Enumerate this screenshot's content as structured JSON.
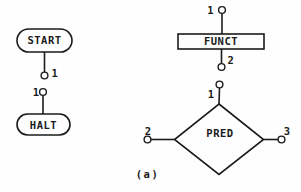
{
  "figure": {
    "caption": "(a)",
    "colors": {
      "ink": "#1b1b1b",
      "paper": "#fefefe"
    },
    "nodes": {
      "start": {
        "shape": "rounded-terminal",
        "label": "START",
        "ports": [
          "1"
        ]
      },
      "halt": {
        "shape": "rounded-terminal",
        "label": "HALT",
        "ports": [
          "1"
        ]
      },
      "funct": {
        "shape": "rectangle",
        "label": "FUNCT",
        "ports": [
          "1",
          "2"
        ]
      },
      "pred": {
        "shape": "diamond",
        "label": "PRED",
        "ports": [
          "1",
          "2",
          "3"
        ]
      }
    }
  }
}
